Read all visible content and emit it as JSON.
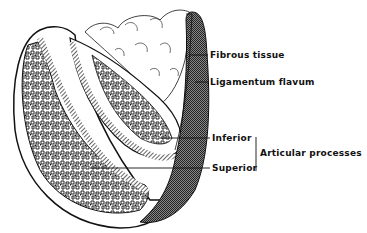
{
  "figure": {
    "type": "anatomical illustration"
  },
  "labels": {
    "fibrous_tissue": "Fibrous tissue",
    "ligamentum_flavum": "Ligamentum flavum",
    "inferior": "Inferior",
    "superior": "Superior",
    "articular_processes": "Articular processes"
  },
  "colors": {
    "ink": "#111111",
    "background": "#ffffff",
    "ligament_shade": "#555555"
  }
}
